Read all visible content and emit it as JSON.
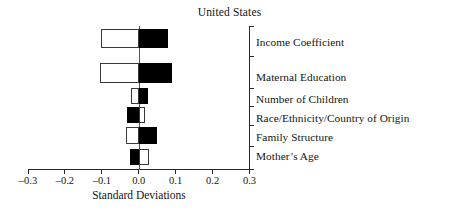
{
  "chart_data": {
    "type": "bar",
    "orientation": "horizontal",
    "title": "United States",
    "xlabel": "Standard Deviations",
    "ylabel": "",
    "xlim": [
      -0.3,
      0.3
    ],
    "xticks": [
      -0.3,
      -0.2,
      -0.1,
      0.0,
      0.1,
      0.2,
      0.3
    ],
    "xtick_labels": [
      "–0.3",
      "–0.2",
      "–0.1",
      "0.0",
      "0.1",
      "0.2",
      "0.3"
    ],
    "grid": false,
    "legend": "none",
    "zero_reference_line": 0.0,
    "categories": [
      "Income Coefficient",
      "Maternal Education",
      "Number of Children",
      "Race/Ethnicity/Country of Origin",
      "Family Structure",
      "Mother’s Age"
    ],
    "series": [
      {
        "name": "white-bar",
        "fill": "#ffffff",
        "edge": "#3a3a3a",
        "values": [
          -0.103,
          -0.105,
          -0.022,
          0.017,
          -0.035,
          0.028
        ]
      },
      {
        "name": "black-bar",
        "fill": "#000000",
        "edge": "#000000",
        "values": [
          0.079,
          0.089,
          0.024,
          -0.031,
          0.05,
          -0.023
        ]
      }
    ],
    "bars": [
      {
        "category": "Income Coefficient",
        "white_from": -0.103,
        "white_to": 0.0,
        "black_from": 0.0,
        "black_to": 0.079
      },
      {
        "category": "Maternal Education",
        "white_from": -0.105,
        "white_to": 0.0,
        "black_from": 0.0,
        "black_to": 0.089
      },
      {
        "category": "Number of Children",
        "white_from": -0.022,
        "white_to": 0.0,
        "black_from": 0.0,
        "black_to": 0.024
      },
      {
        "category": "Race/Ethnicity/Country of Origin",
        "white_from": 0.0,
        "white_to": 0.017,
        "black_from": -0.031,
        "black_to": 0.0
      },
      {
        "category": "Family Structure",
        "white_from": -0.035,
        "white_to": 0.0,
        "black_from": 0.0,
        "black_to": 0.05
      },
      {
        "category": "Mother’s Age",
        "white_from": 0.0,
        "white_to": 0.028,
        "black_from": -0.023,
        "black_to": 0.0
      }
    ]
  },
  "axis": {
    "tick_labels": [
      "–0.3",
      "–0.2",
      "–0.1",
      "0.0",
      "0.1",
      "0.2",
      "0.3"
    ],
    "title": "Standard Deviations"
  },
  "labels": {
    "items": [
      "Income Coefficient",
      "Maternal Education",
      "Number of Children",
      "Race/Ethnicity/Country of Origin",
      "Family Structure",
      "Mother’s Age"
    ]
  },
  "colors": {
    "positive_fill": "#000000",
    "negative_fill": "#ffffff",
    "axis": "#2a2a2a",
    "text": "#151515"
  }
}
